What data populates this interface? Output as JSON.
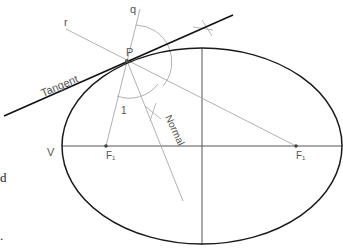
{
  "diagram": {
    "labels": {
      "q": "q",
      "r": "r",
      "P": "P",
      "tangent": "Tangent",
      "normal": "Normal",
      "angle": "1",
      "vertex": "V",
      "focus1": "F₁",
      "focus2": "F₁"
    },
    "margin_text": {
      "d": "d",
      "dot": "."
    },
    "colors": {
      "ellipse": "#1a1a1a",
      "tangent": "#111111",
      "construction": "#9a9a9a",
      "axis": "#444444",
      "label": "#555555"
    }
  }
}
